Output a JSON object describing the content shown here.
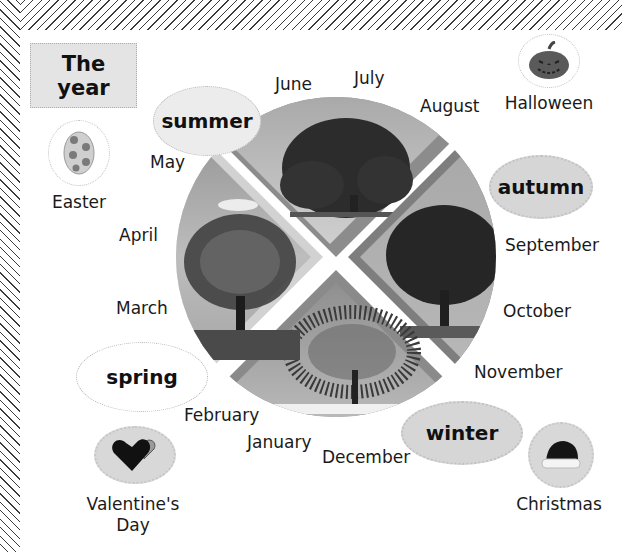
{
  "title": {
    "line1": "The",
    "line2": "year"
  },
  "seasons": {
    "summer": "summer",
    "autumn": "autumn",
    "winter": "winter",
    "spring": "spring"
  },
  "months": {
    "january": "January",
    "february": "February",
    "march": "March",
    "april": "April",
    "may": "May",
    "june": "June",
    "july": "July",
    "august": "August",
    "september": "September",
    "october": "October",
    "november": "November",
    "december": "December"
  },
  "holidays": {
    "halloween": {
      "label": "Halloween",
      "icon": "pumpkin-icon"
    },
    "easter": {
      "label": "Easter",
      "icon": "easter-egg-icon"
    },
    "valentines": {
      "label_line1": "Valentine's",
      "label_line2": "Day",
      "icon": "heart-chocolate-box-icon"
    },
    "christmas": {
      "label": "Christmas",
      "icon": "santa-hat-icon"
    }
  },
  "wheel": {
    "quadrants": [
      {
        "season": "summer",
        "position": "top",
        "image": "tree-full-foliage"
      },
      {
        "season": "autumn",
        "position": "right",
        "image": "tree-thinning-leaves"
      },
      {
        "season": "winter",
        "position": "bottom",
        "image": "tree-bare-snow"
      },
      {
        "season": "spring",
        "position": "left",
        "image": "tree-budding"
      }
    ],
    "colors": {
      "border": "#8a8a8a",
      "spring_border": "#d0d0d0",
      "sky_light": "#c8c8c8",
      "sky_dark": "#9a9a9a",
      "tree": "#2a2a2a"
    }
  }
}
